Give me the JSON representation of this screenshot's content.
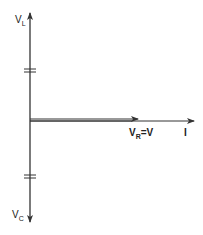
{
  "diagram": {
    "labels": {
      "vl": {
        "main": "V",
        "sub": "L"
      },
      "vc": {
        "main": "V",
        "sub": "C"
      },
      "vr": {
        "main": "V",
        "sub": "R",
        "rest": "=V"
      },
      "i": {
        "main": "I"
      }
    },
    "colors": {
      "line": "#333333",
      "background": "#ffffff"
    }
  }
}
